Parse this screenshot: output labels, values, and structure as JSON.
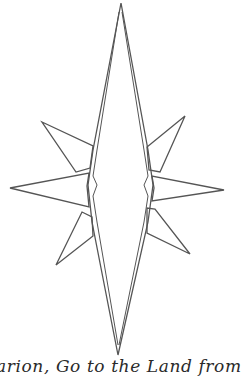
{
  "figure": {
    "stroke_color": "#555555",
    "background_color": "#ffffff",
    "icon": "star-compass-icon"
  },
  "caption": {
    "text": "arion, Go to the Land from"
  }
}
